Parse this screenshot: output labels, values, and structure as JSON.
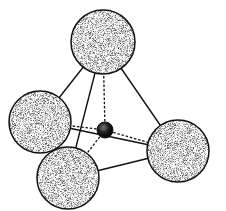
{
  "diagram": {
    "type": "tetrahedral-molecule",
    "colors": {
      "background": "#ffffff",
      "outline": "#111111",
      "sphere_light": "#ffffff",
      "sphere_shade": "#555555",
      "center_atom": "#111111"
    },
    "center_atom": {
      "cx": 105,
      "cy": 130,
      "r": 8
    },
    "outer_atoms": [
      {
        "id": "top",
        "cx": 103,
        "cy": 42,
        "r": 32,
        "shade": "medium"
      },
      {
        "id": "left",
        "cx": 40,
        "cy": 122,
        "r": 31,
        "shade": "dark"
      },
      {
        "id": "right",
        "cx": 178,
        "cy": 151,
        "r": 31,
        "shade": "medium"
      },
      {
        "id": "bottom",
        "cx": 68,
        "cy": 178,
        "r": 31,
        "shade": "light"
      }
    ],
    "edges": [
      {
        "from": "top",
        "to": "left",
        "style": "solid"
      },
      {
        "from": "top",
        "to": "right",
        "style": "solid"
      },
      {
        "from": "top",
        "to": "bottom",
        "style": "solid"
      },
      {
        "from": "left",
        "to": "right",
        "style": "solid"
      },
      {
        "from": "bottom",
        "to": "right",
        "style": "solid"
      }
    ],
    "bonds": [
      {
        "to": "top",
        "style": "dashed"
      },
      {
        "to": "left",
        "style": "dashed"
      },
      {
        "to": "right",
        "style": "dashed"
      },
      {
        "to": "bottom",
        "style": "dashed"
      }
    ]
  }
}
